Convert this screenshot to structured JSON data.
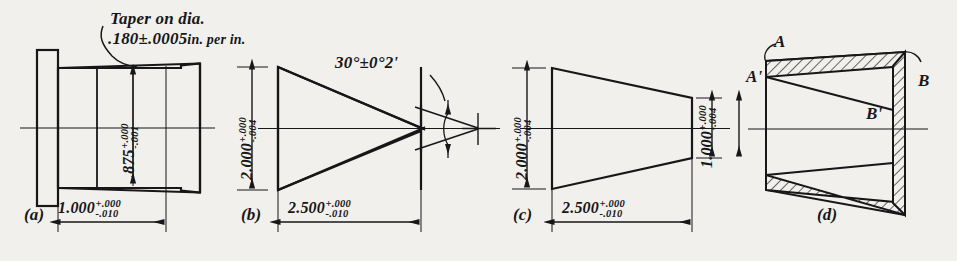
{
  "drawing": {
    "background_color": "#f2f0ec",
    "ink_color": "#17171a",
    "note": {
      "line1": "Taper on dia.",
      "line2_value": ".180±.0005",
      "line2_units": "in. per in."
    },
    "views": [
      {
        "key": "a",
        "label": "(a)",
        "dims": [
          {
            "name": "diameter",
            "value": ".875",
            "tol_plus": "+.000",
            "tol_minus": "-.001",
            "orientation": "vertical"
          },
          {
            "name": "length",
            "value": "1.000",
            "tol_plus": "+.000",
            "tol_minus": "-.010",
            "orientation": "horizontal"
          }
        ]
      },
      {
        "key": "b",
        "label": "(b)",
        "dims": [
          {
            "name": "large-diameter",
            "value": "2.000",
            "tol_plus": "+.000",
            "tol_minus": "-.004",
            "orientation": "vertical"
          },
          {
            "name": "length",
            "value": "2.500",
            "tol_plus": "+.000",
            "tol_minus": "-.010",
            "orientation": "horizontal"
          },
          {
            "name": "included-angle",
            "value": "30°±0°2'",
            "orientation": "angular"
          }
        ]
      },
      {
        "key": "c",
        "label": "(c)",
        "dims": [
          {
            "name": "large-diameter",
            "value": "2.000",
            "tol_plus": "+.000",
            "tol_minus": "-.004",
            "orientation": "vertical"
          },
          {
            "name": "small-diameter",
            "value": "1.000",
            "tol_plus": "+.000",
            "tol_minus": "-.004",
            "orientation": "vertical"
          },
          {
            "name": "length",
            "value": "2.500",
            "tol_plus": "+.000",
            "tol_minus": "-.010",
            "orientation": "horizontal"
          }
        ]
      },
      {
        "key": "d",
        "label": "(d)",
        "points": [
          {
            "name": "point-a",
            "text": "A"
          },
          {
            "name": "point-a-prime",
            "text": "A'"
          },
          {
            "name": "point-b",
            "text": "B"
          },
          {
            "name": "point-b-prime",
            "text": "B'"
          }
        ]
      }
    ]
  }
}
